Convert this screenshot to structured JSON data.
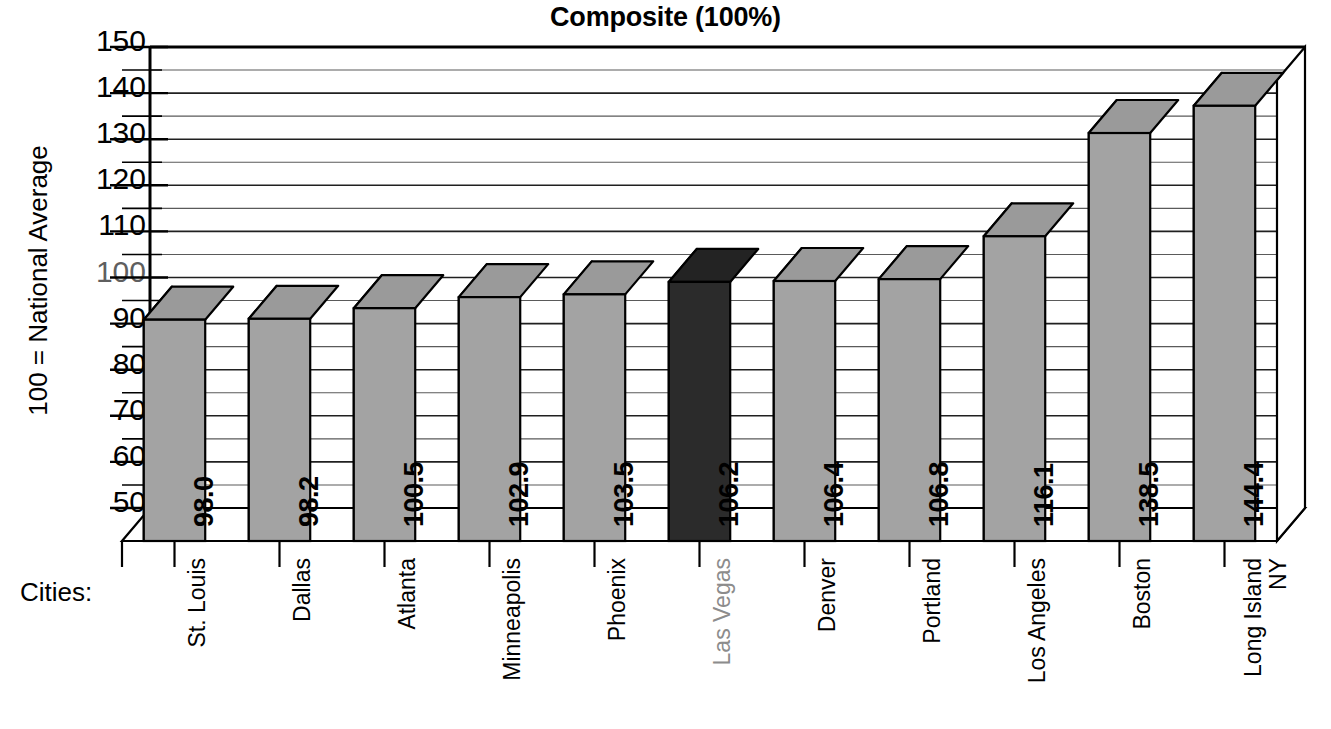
{
  "chart_data": {
    "type": "bar",
    "title": "Composite (100%)",
    "xlabel": "Cities:",
    "ylabel": "100 = National Average",
    "ylim": [
      50,
      150
    ],
    "ytick_step": 10,
    "minor_gridline_step": 5,
    "grid": true,
    "legend": "none",
    "style": "3d-column",
    "categories": [
      "St. Louis",
      "Dallas",
      "Atlanta",
      "Minneapolis",
      "Phoenix",
      "Las Vegas",
      "Denver",
      "Portland",
      "Los Angeles",
      "Boston",
      "Long Island NY"
    ],
    "values": [
      98.0,
      98.2,
      100.5,
      102.9,
      103.5,
      106.2,
      106.4,
      106.8,
      116.1,
      138.5,
      144.4
    ],
    "value_labels": [
      "98.0",
      "98.2",
      "100.5",
      "102.9",
      "103.5",
      "106.2",
      "106.4",
      "106.8",
      "116.1",
      "138.5",
      "144.4"
    ],
    "ytick_labels": [
      "150",
      "140",
      "130",
      "120",
      "110",
      "100",
      "90",
      "80",
      "70",
      "60",
      "50"
    ],
    "highlighted_index": 5,
    "highlighted_category": "Las Vegas",
    "colors": {
      "bar_front": "#a3a3a3",
      "bar_top": "#9a9a9a",
      "bar_side": "#b5b5b5",
      "bar_highlight_front": "#2b2b2b",
      "bar_highlight_top": "#232323",
      "bar_highlight_side": "#3a3a3a",
      "axis": "#000000",
      "gridline": "#4a4a4a",
      "highlight_label": "#8c8c8c",
      "background": "#ffffff"
    }
  },
  "categories_multiline": [
    [
      "St. Louis"
    ],
    [
      "Dallas"
    ],
    [
      "Atlanta"
    ],
    [
      "Minneapolis"
    ],
    [
      "Phoenix"
    ],
    [
      "Las Vegas"
    ],
    [
      "Denver"
    ],
    [
      "Portland"
    ],
    [
      "Los Angeles"
    ],
    [
      "Boston"
    ],
    [
      "Long Island",
      "NY"
    ]
  ]
}
